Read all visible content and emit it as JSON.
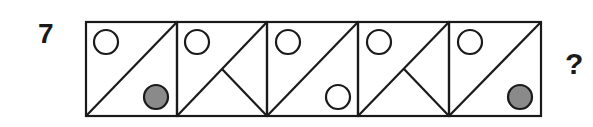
{
  "puzzle": {
    "number": "7",
    "question_mark": "?",
    "colors": {
      "stroke": "#1a1a1a",
      "filled_circle": "#8a8a8a",
      "open_circle": "#ffffff"
    },
    "panels": [
      {
        "index": 1,
        "diagonal": "bottom-left to top-right",
        "extra_line": false,
        "top_left_circle": "open",
        "bottom_right_circle": "filled"
      },
      {
        "index": 2,
        "diagonal": "bottom-left to top-right",
        "extra_line": true,
        "top_left_circle": "open",
        "bottom_right_circle": "none"
      },
      {
        "index": 3,
        "diagonal": "bottom-left to top-right",
        "extra_line": false,
        "top_left_circle": "open",
        "bottom_right_circle": "open"
      },
      {
        "index": 4,
        "diagonal": "bottom-left to top-right",
        "extra_line": true,
        "top_left_circle": "open",
        "bottom_right_circle": "none"
      },
      {
        "index": 5,
        "diagonal": "bottom-left to top-right",
        "extra_line": false,
        "top_left_circle": "open",
        "bottom_right_circle": "filled"
      }
    ]
  }
}
